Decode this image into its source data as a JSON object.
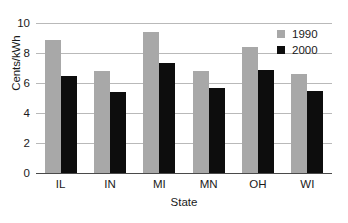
{
  "chart_data": {
    "type": "bar",
    "title": "",
    "xlabel": "State",
    "ylabel": "Cents/kWh",
    "categories": [
      "IL",
      "IN",
      "MI",
      "MN",
      "OH",
      "WI"
    ],
    "series": [
      {
        "name": "1990",
        "color": "#a8a8a8",
        "values": [
          8.9,
          6.8,
          9.4,
          6.8,
          8.4,
          6.6
        ]
      },
      {
        "name": "2000",
        "color": "#0d0d0d",
        "values": [
          6.5,
          5.4,
          7.35,
          5.7,
          6.9,
          5.5
        ]
      }
    ],
    "ylim": [
      0,
      10
    ],
    "yticks": [
      0,
      2,
      4,
      6,
      8,
      10
    ],
    "ytick_labels": [
      "0",
      "2",
      "4",
      "6",
      "8",
      "10"
    ],
    "grid": true,
    "grid_axis": "y",
    "legend_position": "top-right",
    "background": "#ffffff",
    "gridline_color": "#b9b9b9",
    "axis_color": "#4a4a4a",
    "text_color": "#1a1a1a"
  },
  "legend": {
    "entries": [
      {
        "label": "1990",
        "icon": "square-swatch-gray"
      },
      {
        "label": "2000",
        "icon": "square-swatch-black"
      }
    ]
  }
}
